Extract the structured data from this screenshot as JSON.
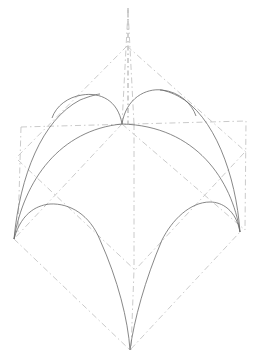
{
  "diagram": {
    "title": "",
    "colors": {
      "background": "#ffffff",
      "construction_lines": "#c4c4c4",
      "arch_ribs": "#6a6a6a",
      "axis": "#8a8a8a"
    },
    "points": {
      "top_apex": [
        128,
        10
      ],
      "upper_diamond_top": [
        127,
        46
      ],
      "crown": [
        122,
        124
      ],
      "left_spring": [
        14,
        239
      ],
      "right_spring": [
        240,
        232
      ],
      "bottom_apex": [
        130,
        350
      ],
      "center": [
        135,
        270
      ]
    },
    "labels": []
  }
}
